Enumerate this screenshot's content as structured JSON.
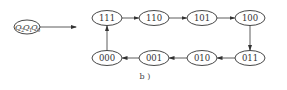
{
  "diagram": {
    "type": "state-transition",
    "state_variable": {
      "symbol": "Q",
      "subscripts": [
        "2",
        "1",
        "0"
      ],
      "label": "Q2Q1Q0"
    },
    "caption": "b )",
    "states": [
      {
        "id": "s111",
        "label": "111",
        "cx": 107,
        "cy": 18
      },
      {
        "id": "s110",
        "label": "110",
        "cx": 154,
        "cy": 18
      },
      {
        "id": "s101",
        "label": "101",
        "cx": 202,
        "cy": 18
      },
      {
        "id": "s100",
        "label": "100",
        "cx": 250,
        "cy": 18
      },
      {
        "id": "s011",
        "label": "011",
        "cx": 250,
        "cy": 58
      },
      {
        "id": "s010",
        "label": "010",
        "cx": 202,
        "cy": 58
      },
      {
        "id": "s001",
        "label": "001",
        "cx": 154,
        "cy": 58
      },
      {
        "id": "s000",
        "label": "000",
        "cx": 107,
        "cy": 58
      }
    ],
    "transitions": [
      {
        "from": "111",
        "to": "110"
      },
      {
        "from": "110",
        "to": "101"
      },
      {
        "from": "101",
        "to": "100"
      },
      {
        "from": "100",
        "to": "011"
      },
      {
        "from": "011",
        "to": "010"
      },
      {
        "from": "010",
        "to": "001"
      },
      {
        "from": "001",
        "to": "000"
      },
      {
        "from": "000",
        "to": "111"
      }
    ],
    "colors": {
      "stroke": "#333333",
      "background": "#ffffff"
    }
  }
}
